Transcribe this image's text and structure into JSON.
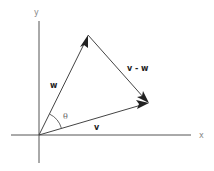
{
  "diagram": {
    "type": "vector-subtraction",
    "axes": {
      "x_label": "x",
      "y_label": "y",
      "origin": [
        39,
        135
      ]
    },
    "vectors": [
      {
        "name": "v",
        "label": "v",
        "from": [
          39,
          135
        ],
        "to": [
          148,
          103
        ]
      },
      {
        "name": "w",
        "label": "w",
        "from": [
          39,
          135
        ],
        "to": [
          88,
          35
        ]
      },
      {
        "name": "v-w",
        "label": "v - w",
        "from": [
          88,
          35
        ],
        "to": [
          148,
          103
        ]
      }
    ],
    "angle": {
      "label": "θ",
      "between": [
        "v",
        "w"
      ]
    },
    "colors": {
      "line": "#444444",
      "arrowhead": "#222222",
      "axis": "#555555",
      "background": "#ffffff"
    }
  }
}
